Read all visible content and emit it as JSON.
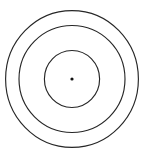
{
  "figure": {
    "title": "Concentric Circles",
    "background_color": "#ffffff",
    "stroke_color": "#262626",
    "dot_color": "#111111",
    "width": 144,
    "height": 155
  },
  "chart_data": {
    "type": "scatter",
    "title": "Concentric Circles",
    "subtitle": "",
    "xlabel": "",
    "ylabel": "",
    "xlim": [
      0,
      144
    ],
    "ylim": [
      0,
      155
    ],
    "grid": false,
    "legend_position": "none",
    "tick_labels_x": [],
    "tick_labels_y": [],
    "annotations": [],
    "center": {
      "label": "center point",
      "x": 72,
      "y": 79,
      "radius": 1.6,
      "color": "#111111"
    },
    "series": [
      {
        "name": "outer ring",
        "shape": "ellipse",
        "cx": 72,
        "cy": 79,
        "rx": 66.4,
        "ry": 68.4,
        "stroke": "#262626",
        "stroke_width": 1.15,
        "fill": "none"
      },
      {
        "name": "middle ring",
        "shape": "ellipse",
        "cx": 72,
        "cy": 79,
        "rx": 53,
        "ry": 53.5,
        "stroke": "#262626",
        "stroke_width": 1.15,
        "fill": "none"
      },
      {
        "name": "inner ring",
        "shape": "ellipse",
        "cx": 72,
        "cy": 79,
        "rx": 27.6,
        "ry": 28.5,
        "stroke": "#262626",
        "stroke_width": 1.15,
        "fill": "none"
      }
    ]
  }
}
